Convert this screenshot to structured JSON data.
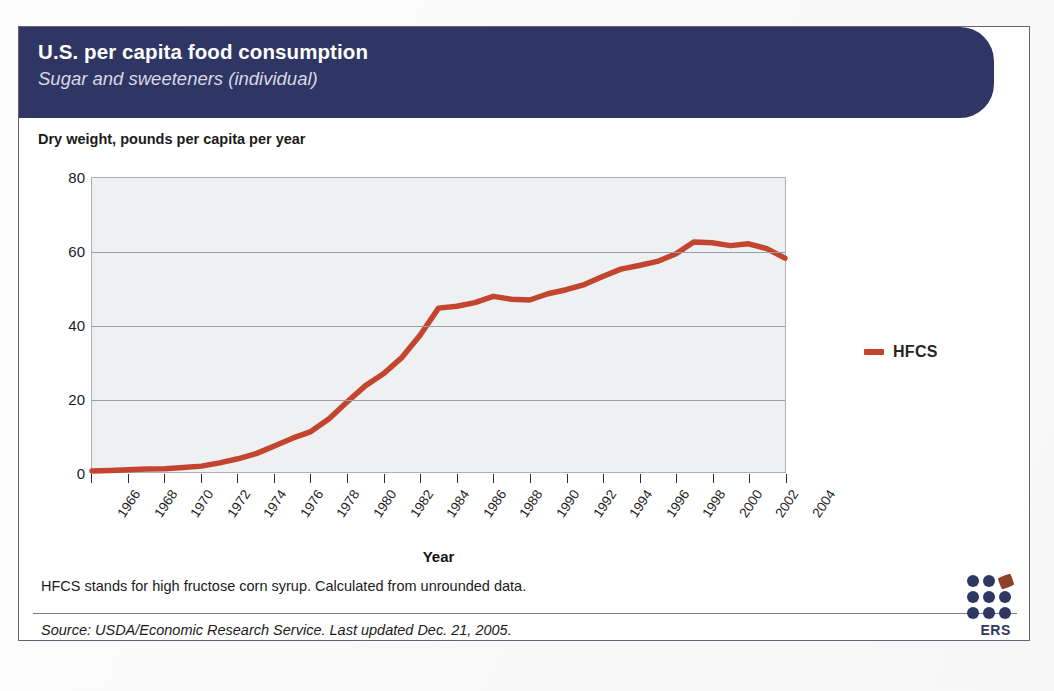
{
  "header": {
    "title": "U.S. per capita food consumption",
    "subtitle": "Sugar and sweeteners (individual)"
  },
  "axis_caption": "Dry weight, pounds per capita per year",
  "legend": {
    "label": "HFCS",
    "swatch_color": "#c4452f"
  },
  "footnote": "HFCS stands for high fructose corn syrup. Calculated from unrounded data.",
  "source": "Source: USDA/Economic Research Service. Last updated Dec. 21, 2005.",
  "logo": {
    "text": "ERS",
    "dot_color": "#2f3663",
    "leaf_color": "#8c4228"
  },
  "colors": {
    "header_navy": "#2f3663",
    "series_red": "#c4452f",
    "plot_background": "#eef0f1",
    "gridline": "#9aa2a8"
  },
  "chart_data": {
    "type": "line",
    "xlabel": "Year",
    "ylabel": "Dry weight, pounds per capita per year",
    "xlim": [
      1966,
      2004
    ],
    "ylim": [
      0,
      80
    ],
    "yticks": [
      0,
      20,
      40,
      60,
      80
    ],
    "xticks": [
      1966,
      1968,
      1970,
      1972,
      1974,
      1976,
      1978,
      1980,
      1982,
      1984,
      1986,
      1988,
      1990,
      1992,
      1994,
      1996,
      1998,
      2000,
      2002,
      2004
    ],
    "grid": true,
    "legend_position": "right",
    "x": [
      1966,
      1967,
      1968,
      1969,
      1970,
      1971,
      1972,
      1973,
      1974,
      1975,
      1976,
      1977,
      1978,
      1979,
      1980,
      1981,
      1982,
      1983,
      1984,
      1985,
      1986,
      1987,
      1988,
      1989,
      1990,
      1991,
      1992,
      1993,
      1994,
      1995,
      1996,
      1997,
      1998,
      1999,
      2000,
      2001,
      2002,
      2003,
      2004
    ],
    "series": [
      {
        "name": "HFCS",
        "color": "#c4452f",
        "values": [
          0.3,
          0.4,
          0.6,
          0.8,
          0.9,
          1.2,
          1.6,
          2.5,
          3.6,
          5.0,
          7.1,
          9.2,
          11.0,
          14.5,
          19.1,
          23.5,
          26.8,
          31.2,
          37.3,
          44.6,
          45.1,
          46.1,
          47.8,
          47.0,
          46.8,
          48.5,
          49.6,
          51.0,
          53.2,
          55.2,
          56.2,
          57.3,
          59.3,
          62.6,
          62.4,
          61.6,
          62.1,
          60.8,
          58.2
        ]
      }
    ]
  }
}
